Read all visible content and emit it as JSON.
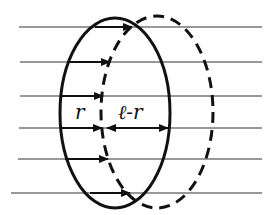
{
  "diagram": {
    "labels": {
      "r": "r",
      "l_minus_r": "ℓ-r"
    },
    "colors": {
      "ink": "#111111",
      "line": "#333333",
      "background": "#ffffff"
    },
    "field_lines_y": [
      27,
      62,
      96,
      128,
      159,
      193
    ],
    "solid_loop": {
      "cx": 115,
      "cy": 113,
      "rx": 55,
      "ry": 95,
      "style": "solid"
    },
    "dashed_loop": {
      "cx": 157,
      "cy": 112,
      "rx": 56,
      "ry": 96,
      "style": "dashed"
    }
  }
}
